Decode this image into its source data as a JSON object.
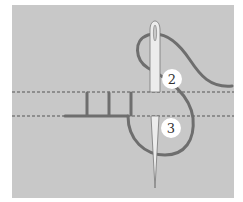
{
  "diagram": {
    "colors": {
      "background": "#ffffff",
      "fabric": "#c8c8c8",
      "thread": "#6e6e6e",
      "needle": "#ececec",
      "needle_outline": "#777777",
      "guide_line": "#555555",
      "label_circle": "#ffffff",
      "label_text": "#333333"
    },
    "step_labels": [
      {
        "id": "step-2",
        "text": "2"
      },
      {
        "id": "step-3",
        "text": "3"
      }
    ],
    "completed_stitches": 3,
    "guide_lines": 2
  }
}
